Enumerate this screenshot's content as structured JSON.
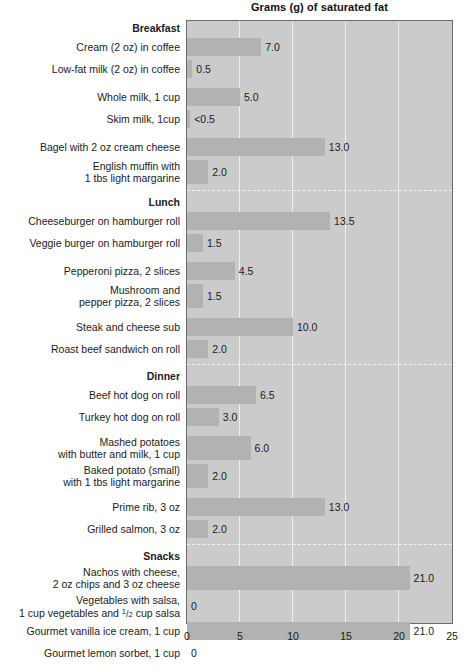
{
  "chart_data": {
    "type": "bar",
    "orientation": "horizontal",
    "title": "Grams (g) of saturated fat",
    "xlabel": "",
    "ylabel": "",
    "xlim": [
      0,
      25
    ],
    "xticks": [
      0,
      5,
      10,
      15,
      20,
      25
    ],
    "xtick_labels": [
      "0",
      "5",
      "10",
      "15",
      "20",
      "25"
    ],
    "grid": true,
    "legend": "none",
    "bar_color": "#b2b2b2",
    "plot_background": "#cbcbcb",
    "gridline_color": "#efefef",
    "section_divider_color": "#f2f2f2",
    "sections": [
      {
        "name": "Breakfast",
        "items": [
          {
            "label": "Cream (2 oz) in coffee",
            "label2": "",
            "value": 7.0,
            "value_label": "7.0"
          },
          {
            "label": "Low-fat milk (2 oz) in coffee",
            "label2": "",
            "value": 0.5,
            "value_label": "0.5"
          },
          {
            "label": "Whole milk, 1 cup",
            "label2": "",
            "value": 5.0,
            "value_label": "5.0"
          },
          {
            "label": "Skim milk, 1cup",
            "label2": "",
            "value": 0.3,
            "value_label": "<0.5"
          },
          {
            "label": "Bagel with 2 oz cream cheese",
            "label2": "",
            "value": 13.0,
            "value_label": "13.0"
          },
          {
            "label": "English muffin with",
            "label2": "1 tbs light margarine",
            "value": 2.0,
            "value_label": "2.0"
          }
        ]
      },
      {
        "name": "Lunch",
        "items": [
          {
            "label": "Cheeseburger on hamburger roll",
            "label2": "",
            "value": 13.5,
            "value_label": "13.5"
          },
          {
            "label": "Veggie burger on hamburger roll",
            "label2": "",
            "value": 1.5,
            "value_label": "1.5"
          },
          {
            "label": "Pepperoni pizza, 2 slices",
            "label2": "",
            "value": 4.5,
            "value_label": "4.5"
          },
          {
            "label": "Mushroom and",
            "label2": "pepper pizza, 2 slices",
            "value": 1.5,
            "value_label": "1.5"
          },
          {
            "label": "Steak and cheese sub",
            "label2": "",
            "value": 10.0,
            "value_label": "10.0"
          },
          {
            "label": "Roast beef sandwich on roll",
            "label2": "",
            "value": 2.0,
            "value_label": "2.0"
          }
        ]
      },
      {
        "name": "Dinner",
        "items": [
          {
            "label": "Beef hot dog on roll",
            "label2": "",
            "value": 6.5,
            "value_label": "6.5"
          },
          {
            "label": "Turkey hot dog on roll",
            "label2": "",
            "value": 3.0,
            "value_label": "3.0"
          },
          {
            "label": "Mashed potatoes",
            "label2": "with butter and milk, 1 cup",
            "value": 6.0,
            "value_label": "6.0"
          },
          {
            "label": "Baked potato (small)",
            "label2": "with 1 tbs light margarine",
            "value": 2.0,
            "value_label": "2.0"
          },
          {
            "label": "Prime rib, 3 oz",
            "label2": "",
            "value": 13.0,
            "value_label": "13.0"
          },
          {
            "label": "Grilled salmon, 3 oz",
            "label2": "",
            "value": 2.0,
            "value_label": "2.0"
          }
        ]
      },
      {
        "name": "Snacks",
        "items": [
          {
            "label": "Nachos with cheese,",
            "label2": "2 oz chips and 3 oz cheese",
            "value": 21.0,
            "value_label": "21.0"
          },
          {
            "label": "Vegetables with salsa,",
            "label2": "1 cup vegetables and ½ cup salsa",
            "value": 0,
            "value_label": "0"
          },
          {
            "label": "Gourmet vanilla ice cream, 1 cup",
            "label2": "",
            "value": 21.0,
            "value_label": "21.0"
          },
          {
            "label": "Gourmet lemon sorbet, 1 cup",
            "label2": "",
            "value": 0,
            "value_label": "0"
          }
        ]
      }
    ]
  }
}
